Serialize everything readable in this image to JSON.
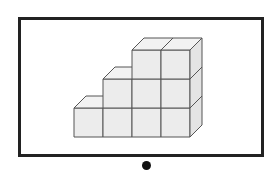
{
  "diagram": {
    "columns": [
      {
        "index": 0,
        "height": 1
      },
      {
        "index": 1,
        "height": 2
      },
      {
        "index": 2,
        "height": 3
      },
      {
        "index": 3,
        "height": 3
      }
    ],
    "total_cubes": 9,
    "colors": {
      "cube_front": "#ececec",
      "cube_top": "#f2f2f2",
      "cube_side": "#e4e4e4",
      "edge": "#555555",
      "frame": "#222222",
      "dot": "#111111"
    }
  }
}
